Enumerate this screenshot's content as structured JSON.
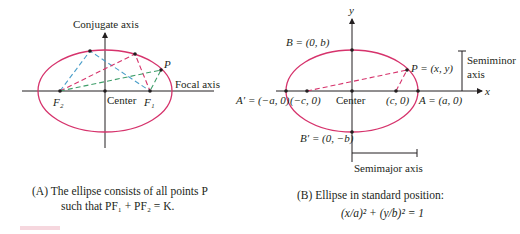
{
  "colors": {
    "ellipse": "#d6336c",
    "axis": "#231f20",
    "blue_dash": "#4a9ec9",
    "pink_dash": "#d6336c",
    "green_dash": "#3f9e6a",
    "point": "#231f20"
  },
  "figure_a": {
    "axis_labels": {
      "vertical": "Conjugate axis",
      "horizontal": "Focal axis"
    },
    "points": {
      "f2": "F₂",
      "center": "Center",
      "f1": "F₁",
      "p": "P"
    },
    "caption_line1": "(A)  The ellipse consists of all points P",
    "caption_line2": "such that PF₁ + PF₂ = K."
  },
  "figure_b": {
    "axis_labels": {
      "x": "x",
      "y": "y"
    },
    "points": {
      "b": "B = (0, b)",
      "b_prime": "B′ = (0, −b)",
      "a_prime": "A′ = (−a, 0)",
      "neg_c": "(−c, 0)",
      "center": "Center",
      "c": "(c, 0)",
      "a": "A = (a, 0)",
      "p": "P = (x, y)"
    },
    "semiminor_label_1": "Semiminor",
    "semiminor_label_2": "axis",
    "semimajor_label": "Semimajor axis",
    "caption_line1": "(B)  Ellipse in standard position:",
    "equation": "(x/a)² + (y/b)² = 1"
  }
}
